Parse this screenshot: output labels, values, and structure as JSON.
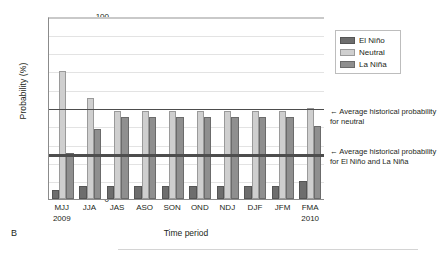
{
  "panel_label": "B",
  "legend": {
    "items": [
      {
        "key": "elnino",
        "label": "El Niño",
        "color": "#6d6d6d"
      },
      {
        "key": "neutral",
        "label": "Neutral",
        "color": "#cfcfcf"
      },
      {
        "key": "lanina",
        "label": "La Niña",
        "color": "#8f8f8f"
      }
    ]
  },
  "annotations": {
    "neutral": "← Average historical probability for neutral",
    "enso": "← Average historical probability for El Niño and La Niña"
  },
  "axes": {
    "y_title": "Probability (%)",
    "x_title": "Time period",
    "y_ticks": [
      "100",
      "90",
      "80",
      "70",
      "60",
      "50",
      "40",
      "30",
      "20",
      "10",
      "0"
    ]
  },
  "x_labels": [
    {
      "period": "MJJ",
      "year": "2009"
    },
    {
      "period": "JJA",
      "year": ""
    },
    {
      "period": "JAS",
      "year": ""
    },
    {
      "period": "ASO",
      "year": ""
    },
    {
      "period": "SON",
      "year": ""
    },
    {
      "period": "OND",
      "year": ""
    },
    {
      "period": "NDJ",
      "year": ""
    },
    {
      "period": "DJF",
      "year": ""
    },
    {
      "period": "JFM",
      "year": ""
    },
    {
      "period": "FMA",
      "year": "2010"
    }
  ],
  "chart_data": {
    "type": "bar",
    "title": "",
    "subtitle": "",
    "xlabel": "Time period",
    "ylabel": "Probability (%)",
    "ylim": [
      0,
      100
    ],
    "ytick_step": 10,
    "grid": true,
    "legend_position": "top-right",
    "categories": [
      "MJJ 2009",
      "JJA",
      "JAS",
      "ASO",
      "SON",
      "OND",
      "NDJ",
      "DJF",
      "JFM",
      "FMA 2010"
    ],
    "series": [
      {
        "name": "El Niño",
        "color": "#6d6d6d",
        "values": [
          5,
          7,
          7,
          7,
          7,
          7,
          7,
          7,
          7,
          10
        ]
      },
      {
        "name": "Neutral",
        "color": "#cfcfcf",
        "values": [
          70,
          55,
          48,
          48,
          48,
          48,
          48,
          48,
          48,
          50
        ]
      },
      {
        "name": "La Niña",
        "color": "#8f8f8f",
        "values": [
          25,
          38,
          45,
          45,
          45,
          45,
          45,
          45,
          45,
          40
        ]
      }
    ],
    "reference_lines": [
      {
        "name": "Average historical probability for neutral",
        "value": 50,
        "color": "#4d4d4d"
      },
      {
        "name": "Average historical probability for El Niño and La Niña",
        "value": 25,
        "color": "#4d4d4d"
      }
    ]
  }
}
